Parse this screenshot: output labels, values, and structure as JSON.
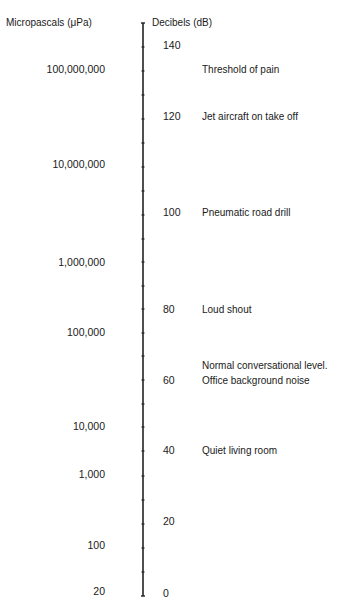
{
  "chart_data": {
    "type": "table",
    "title": "",
    "left_axis_label": "Micropascals (μPa)",
    "right_axis_label": "Decibels (dB)",
    "pascal_ticks": [
      {
        "label": "100,000,000",
        "y": 70
      },
      {
        "label": "10,000,000",
        "y": 165
      },
      {
        "label": "1,000,000",
        "y": 263
      },
      {
        "label": "100,000",
        "y": 333
      },
      {
        "label": "10,000",
        "y": 427
      },
      {
        "label": "1,000",
        "y": 475
      },
      {
        "label": "100",
        "y": 546
      },
      {
        "label": "20",
        "y": 592
      }
    ],
    "decibel_ticks": [
      {
        "label": "140",
        "y": 46
      },
      {
        "label": "120",
        "y": 117
      },
      {
        "label": "100",
        "y": 213
      },
      {
        "label": "80",
        "y": 310
      },
      {
        "label": "60",
        "y": 381
      },
      {
        "label": "40",
        "y": 451
      },
      {
        "label": "20",
        "y": 522
      },
      {
        "label": "0",
        "y": 594
      }
    ],
    "annotations": [
      {
        "text": "Threshold of pain",
        "db": 130,
        "y": 70
      },
      {
        "text": "Jet aircraft on take off",
        "db": 120,
        "y": 117
      },
      {
        "text": "Pneumatic road drill",
        "db": 100,
        "y": 213
      },
      {
        "text": "Loud shout",
        "db": 80,
        "y": 310
      },
      {
        "text": "Normal conversational level.",
        "db": 60,
        "y": 366
      },
      {
        "text": "Office background noise",
        "db": 60,
        "y": 381
      },
      {
        "text": "Quiet living room",
        "db": 40,
        "y": 451
      }
    ],
    "axis_tick_y": [
      47,
      71,
      95,
      119,
      143,
      167,
      191,
      215,
      239,
      262,
      286,
      309,
      333,
      356,
      380,
      404,
      427,
      451,
      476,
      500,
      524,
      548,
      572
    ],
    "axis_top_y": 23,
    "axis_bottom_y": 596
  },
  "labels": {
    "left_header": "Micropascals (μPa)",
    "right_header": "Decibels (dB)"
  }
}
